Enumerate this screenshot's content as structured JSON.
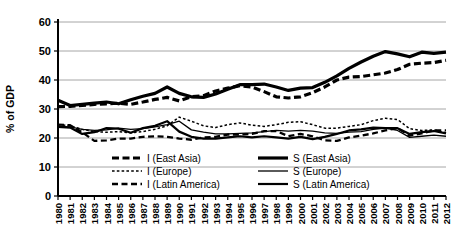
{
  "chart_data": {
    "type": "line",
    "title": "",
    "xlabel": "",
    "ylabel": "% of GDP",
    "ylim": [
      0,
      60
    ],
    "yticks": [
      0,
      10,
      20,
      30,
      40,
      50,
      60
    ],
    "grid": true,
    "legend_position": "inside-bottom",
    "x": [
      1980,
      1981,
      1982,
      1983,
      1984,
      1985,
      1986,
      1987,
      1988,
      1989,
      1990,
      1991,
      1992,
      1993,
      1994,
      1995,
      1996,
      1997,
      1998,
      1999,
      2000,
      2001,
      2002,
      2003,
      2004,
      2005,
      2006,
      2007,
      2008,
      2009,
      2010,
      2011,
      2012
    ],
    "series": [
      {
        "name": "I (East Asia)",
        "style": "dashed-thick",
        "values": [
          30.8,
          30.9,
          31.2,
          31.6,
          31.8,
          32.0,
          31.6,
          32.4,
          33.3,
          34.0,
          32.8,
          34.2,
          34.6,
          36.2,
          37.2,
          38.0,
          37.6,
          36.0,
          34.2,
          33.8,
          34.2,
          35.6,
          37.6,
          40.0,
          41.0,
          41.2,
          41.8,
          42.4,
          43.6,
          45.4,
          45.8,
          46.0,
          46.8
        ]
      },
      {
        "name": "I (Europe)",
        "style": "dotted-thin",
        "values": [
          24.6,
          24.2,
          23.0,
          22.2,
          22.0,
          22.2,
          21.8,
          22.2,
          23.0,
          24.2,
          27.2,
          25.8,
          24.2,
          23.6,
          24.6,
          25.2,
          24.4,
          24.0,
          24.6,
          25.4,
          25.6,
          24.6,
          23.4,
          23.4,
          24.0,
          24.6,
          26.0,
          26.8,
          26.4,
          23.2,
          22.6,
          22.8,
          21.8
        ]
      },
      {
        "name": "I (Latin America)",
        "style": "dashed-med",
        "values": [
          24.6,
          24.4,
          22.0,
          19.0,
          19.2,
          19.8,
          19.8,
          20.4,
          20.6,
          20.4,
          19.8,
          19.4,
          20.2,
          20.4,
          21.2,
          21.2,
          21.4,
          22.4,
          22.4,
          20.6,
          21.4,
          20.6,
          19.2,
          19.0,
          20.2,
          20.8,
          21.6,
          22.6,
          23.4,
          20.8,
          21.6,
          22.6,
          22.6
        ]
      },
      {
        "name": "S (East Asia)",
        "style": "solid-thick",
        "values": [
          33.0,
          31.2,
          31.6,
          32.0,
          32.4,
          31.8,
          33.2,
          34.4,
          35.4,
          37.6,
          35.4,
          34.2,
          34.0,
          35.2,
          36.8,
          38.4,
          38.4,
          38.6,
          37.6,
          36.4,
          37.2,
          37.4,
          39.2,
          41.4,
          44.0,
          46.2,
          48.2,
          49.8,
          49.0,
          48.0,
          49.6,
          49.2,
          49.6
        ]
      },
      {
        "name": "S (Europe)",
        "style": "solid-thin",
        "values": [
          24.0,
          23.8,
          23.0,
          22.6,
          22.8,
          23.4,
          23.0,
          23.2,
          23.8,
          24.6,
          25.8,
          22.8,
          22.0,
          21.4,
          21.4,
          21.6,
          21.8,
          22.2,
          22.6,
          22.4,
          22.6,
          22.4,
          21.8,
          21.6,
          22.0,
          22.2,
          23.0,
          23.4,
          22.6,
          20.2,
          20.6,
          21.0,
          20.6
        ]
      },
      {
        "name": "S (Latin America)",
        "style": "solid-med",
        "values": [
          23.8,
          23.6,
          21.4,
          22.0,
          23.4,
          23.2,
          21.8,
          23.4,
          24.2,
          25.8,
          22.2,
          20.4,
          19.8,
          19.8,
          20.2,
          20.6,
          20.2,
          20.6,
          20.2,
          19.8,
          20.4,
          19.6,
          20.4,
          21.4,
          22.6,
          23.0,
          23.6,
          23.4,
          23.4,
          21.4,
          22.0,
          22.4,
          21.6
        ]
      }
    ]
  },
  "legend": {
    "items": [
      {
        "label": "I (East Asia)"
      },
      {
        "label": "I (Europe)"
      },
      {
        "label": "I (Latin America)"
      },
      {
        "label": "S (East Asia)"
      },
      {
        "label": "S (Europe)"
      },
      {
        "label": "S (Latin America)"
      }
    ]
  }
}
